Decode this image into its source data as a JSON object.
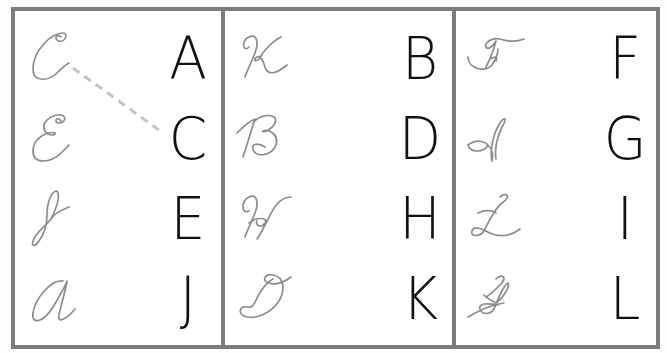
{
  "worksheet": {
    "type": "cursive-to-print letter matching",
    "colors": {
      "border": "#7c7c7c",
      "cursive": "#8c8c8c",
      "print": "#111111",
      "match_line": "#c4c4c4"
    },
    "example_match": {
      "from_panel": 0,
      "from_row": 0,
      "from_cursive": "C",
      "to_panel": 0,
      "to_row": 1,
      "to_print": "C",
      "style": "dashed"
    },
    "panels": [
      {
        "cursive": [
          "C",
          "E",
          "J",
          "A"
        ],
        "print": [
          "A",
          "C",
          "E",
          "J"
        ]
      },
      {
        "cursive": [
          "K",
          "B",
          "H",
          "D"
        ],
        "print": [
          "B",
          "D",
          "H",
          "K"
        ]
      },
      {
        "cursive": [
          "F",
          "I",
          "L",
          "G"
        ],
        "print": [
          "F",
          "G",
          "I",
          "L"
        ]
      }
    ]
  }
}
